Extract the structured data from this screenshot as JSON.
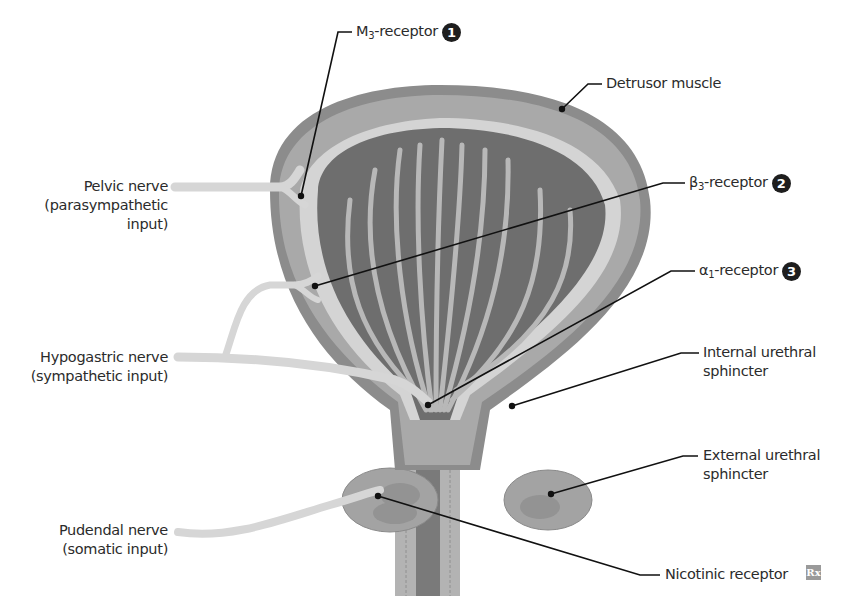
{
  "diagram": {
    "labels_left": {
      "pelvic_nerve": {
        "line1": "Pelvic nerve",
        "line2": "(parasympathetic",
        "line3": "input)"
      },
      "hypogastric_nerve": {
        "line1": "Hypogastric nerve",
        "line2": "(sympathetic input)"
      },
      "pudendal_nerve": {
        "line1": "Pudendal nerve",
        "line2": "(somatic input)"
      }
    },
    "labels_right": {
      "m3_receptor": {
        "prefix": "M",
        "sub": "3",
        "suffix": "-receptor",
        "badge": "1"
      },
      "detrusor_muscle": {
        "text": "Detrusor muscle"
      },
      "beta3_receptor": {
        "prefix": "β",
        "sub": "3",
        "suffix": "-receptor",
        "badge": "2"
      },
      "alpha1_receptor": {
        "prefix": "α",
        "sub": "1",
        "suffix": "-receptor",
        "badge": "3"
      },
      "internal_sphincter": {
        "line1": "Internal urethral",
        "line2": "sphincter"
      },
      "external_sphincter": {
        "line1": "External urethral",
        "line2": "sphincter"
      },
      "nicotinic_receptor": {
        "text": "Nicotinic receptor"
      }
    },
    "logo": "Rx",
    "colors": {
      "outer_wall": "#8c8c8c",
      "detrusor": "#a9a9a9",
      "mucosa_light": "#d4d4d4",
      "lumen_dark": "#6e6e6e",
      "folds_light": "#b8b8b8",
      "nerve": "#d6d6d6",
      "leader": "#111111"
    }
  }
}
